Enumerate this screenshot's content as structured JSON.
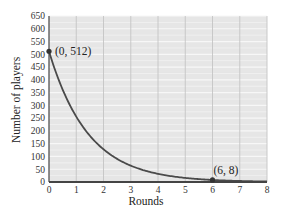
{
  "chart_data": {
    "type": "line",
    "title": "",
    "xlabel": "Rounds",
    "ylabel": "Number of players",
    "xlim": [
      0,
      8
    ],
    "ylim": [
      0,
      650
    ],
    "x_ticks": [
      0,
      1,
      2,
      3,
      4,
      5,
      6,
      7,
      8
    ],
    "y_ticks": [
      0,
      50,
      100,
      150,
      200,
      250,
      300,
      350,
      400,
      450,
      500,
      550,
      600,
      650
    ],
    "grid": true,
    "legend": null,
    "series": [
      {
        "name": "Number of players",
        "x": [
          0,
          1,
          2,
          3,
          4,
          5,
          6,
          7,
          8
        ],
        "values": [
          512,
          256,
          128,
          64,
          32,
          16,
          8,
          4,
          2
        ]
      }
    ],
    "annotations": [
      {
        "label": "(0, 512)",
        "x": 0,
        "y": 512
      },
      {
        "label": "(6, 8)",
        "x": 6,
        "y": 8
      }
    ]
  },
  "colors": {
    "plot_background": "#e6e6e6",
    "h_grid": "#f7f7f7",
    "v_grid": "#c4c4c4",
    "curve": "#4a4a4a",
    "axis": "#444444"
  }
}
